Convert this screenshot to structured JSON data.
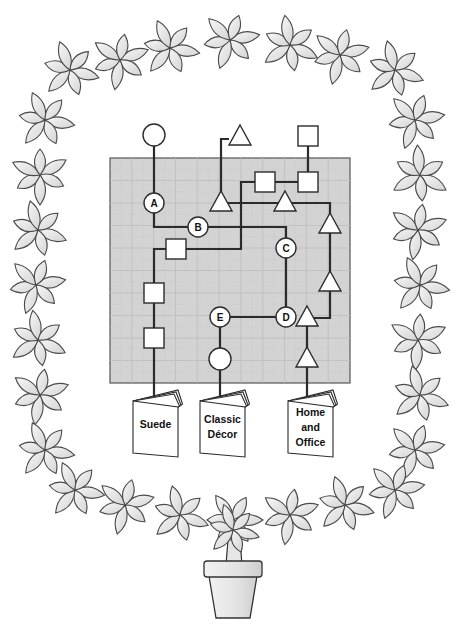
{
  "diagram": {
    "type": "path-maze-puzzle",
    "frame": "leaf-wreath-topiary-in-pot",
    "colors": {
      "grid_background": "#d3d3d3",
      "lines": "#2b2b2b",
      "shapes_fill": "#ffffff",
      "leaves": "#e8e8e8"
    },
    "grid": {
      "x": 110,
      "y": 158,
      "width": 240,
      "height": 225,
      "columns": 11,
      "rows": 10
    },
    "nodes": [
      {
        "id": "A",
        "label": "A",
        "shape": "labeled-circle",
        "x": 154,
        "y": 203
      },
      {
        "id": "B",
        "label": "B",
        "shape": "labeled-circle",
        "x": 198,
        "y": 227
      },
      {
        "id": "C",
        "label": "C",
        "shape": "labeled-circle",
        "x": 286,
        "y": 248
      },
      {
        "id": "D",
        "label": "D",
        "shape": "labeled-circle",
        "x": 286,
        "y": 317
      },
      {
        "id": "E",
        "label": "E",
        "shape": "labeled-circle",
        "x": 220,
        "y": 317
      }
    ],
    "symbols": [
      {
        "shape": "circle",
        "x": 154,
        "y": 135
      },
      {
        "shape": "triangle",
        "x": 240,
        "y": 137
      },
      {
        "shape": "square",
        "x": 308,
        "y": 136
      },
      {
        "shape": "square",
        "x": 265,
        "y": 182
      },
      {
        "shape": "square",
        "x": 308,
        "y": 182
      },
      {
        "shape": "triangle",
        "x": 221,
        "y": 203
      },
      {
        "shape": "triangle",
        "x": 285,
        "y": 203
      },
      {
        "shape": "triangle",
        "x": 330,
        "y": 225
      },
      {
        "shape": "square",
        "x": 176,
        "y": 249
      },
      {
        "shape": "triangle",
        "x": 330,
        "y": 283
      },
      {
        "shape": "square",
        "x": 154,
        "y": 293
      },
      {
        "shape": "triangle",
        "x": 307,
        "y": 318
      },
      {
        "shape": "square",
        "x": 154,
        "y": 338
      },
      {
        "shape": "circle",
        "x": 220,
        "y": 359
      },
      {
        "shape": "triangle",
        "x": 307,
        "y": 359
      }
    ],
    "books": [
      {
        "title_lines": [
          "Suede"
        ],
        "title": "Suede",
        "x": 133,
        "connect_x": 154
      },
      {
        "title_lines": [
          "Classic",
          "Décor"
        ],
        "title": "Classic Décor",
        "x": 200,
        "connect_x": 220
      },
      {
        "title_lines": [
          "Home",
          "and",
          "Office"
        ],
        "title": "Home and Office",
        "x": 288,
        "connect_x": 307
      }
    ]
  }
}
